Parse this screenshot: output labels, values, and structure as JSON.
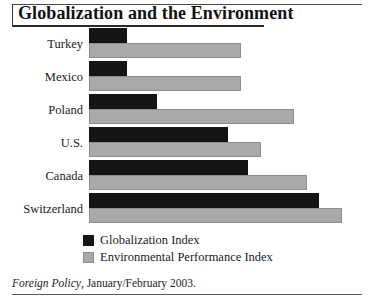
{
  "title": "Globalization and the Environment",
  "legend": [
    {
      "key": "globalization",
      "label": "Globalization Index",
      "color": "#151515"
    },
    {
      "key": "environment",
      "label": "Environmental Performance Index",
      "color": "#a9a9a9"
    }
  ],
  "footer": {
    "source": "Foreign Policy",
    "rest": ", January/February 2003."
  },
  "chart_data": {
    "type": "bar",
    "orientation": "horizontal",
    "title": "Globalization and the Environment",
    "xlabel": "",
    "ylabel": "",
    "grid": false,
    "legend_position": "bottom-left",
    "axis_note": "No numeric axis or tick labels shown; values are relative bar lengths read off the plot (0-100 scale).",
    "xlim": [
      0,
      100
    ],
    "categories": [
      "Turkey",
      "Mexico",
      "Poland",
      "U.S.",
      "Canada",
      "Switzerland"
    ],
    "series": [
      {
        "name": "Globalization Index",
        "color": "#151515",
        "values": [
          15,
          15,
          27,
          55,
          63,
          91
        ]
      },
      {
        "name": "Environmental Performance Index",
        "color": "#a9a9a9",
        "values": [
          60,
          60,
          81,
          68,
          86,
          100
        ]
      }
    ]
  }
}
